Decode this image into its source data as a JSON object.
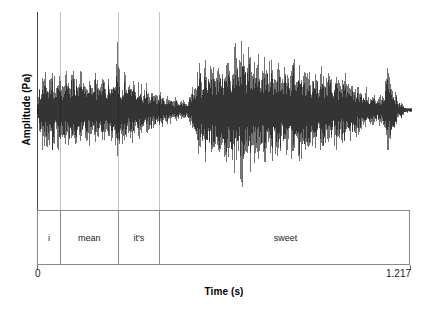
{
  "chart_data": {
    "type": "line",
    "title": "",
    "subtitle": "",
    "xlabel": "Time (s)",
    "ylabel": "Amplitude (Pa)",
    "xlim": [
      0,
      1.217
    ],
    "ylim": [
      -1,
      1
    ],
    "xtick_labels": [
      "0",
      "1.217"
    ],
    "xtick_values": [
      0,
      1.217
    ],
    "ytick_labels": [],
    "grid": false,
    "legend": null,
    "series_name": "speech waveform",
    "series_color": "#000000",
    "baseline": 0,
    "annotation_tier": {
      "name": "words",
      "boundaries_s": [
        0,
        0.0746,
        0.2627,
        0.3989,
        1.217
      ],
      "segments": [
        {
          "label": "i",
          "start_s": 0,
          "end_s": 0.0746
        },
        {
          "label": "mean",
          "start_s": 0.0746,
          "end_s": 0.2627
        },
        {
          "label": "it's",
          "start_s": 0.2627,
          "end_s": 0.3989
        },
        {
          "label": "sweet",
          "start_s": 0.3989,
          "end_s": 1.217
        }
      ]
    },
    "envelope": [
      [
        0.0,
        0.04
      ],
      [
        0.008,
        0.4
      ],
      [
        0.016,
        0.52
      ],
      [
        0.024,
        0.47
      ],
      [
        0.033,
        0.58
      ],
      [
        0.041,
        0.5
      ],
      [
        0.049,
        0.55
      ],
      [
        0.057,
        0.46
      ],
      [
        0.065,
        0.52
      ],
      [
        0.074,
        0.44
      ],
      [
        0.082,
        0.49
      ],
      [
        0.09,
        0.41
      ],
      [
        0.098,
        0.46
      ],
      [
        0.106,
        0.53
      ],
      [
        0.115,
        0.45
      ],
      [
        0.123,
        0.5
      ],
      [
        0.131,
        0.43
      ],
      [
        0.139,
        0.48
      ],
      [
        0.147,
        0.42
      ],
      [
        0.156,
        0.47
      ],
      [
        0.164,
        0.4
      ],
      [
        0.172,
        0.45
      ],
      [
        0.18,
        0.38
      ],
      [
        0.188,
        0.43
      ],
      [
        0.197,
        0.47
      ],
      [
        0.205,
        0.4
      ],
      [
        0.213,
        0.44
      ],
      [
        0.221,
        0.38
      ],
      [
        0.229,
        0.42
      ],
      [
        0.238,
        0.36
      ],
      [
        0.246,
        0.41
      ],
      [
        0.254,
        0.46
      ],
      [
        0.262,
        0.74
      ],
      [
        0.27,
        0.52
      ],
      [
        0.279,
        0.44
      ],
      [
        0.287,
        0.48
      ],
      [
        0.295,
        0.4
      ],
      [
        0.303,
        0.44
      ],
      [
        0.311,
        0.37
      ],
      [
        0.32,
        0.41
      ],
      [
        0.328,
        0.34
      ],
      [
        0.336,
        0.38
      ],
      [
        0.344,
        0.31
      ],
      [
        0.352,
        0.35
      ],
      [
        0.361,
        0.28
      ],
      [
        0.369,
        0.32
      ],
      [
        0.377,
        0.25
      ],
      [
        0.385,
        0.28
      ],
      [
        0.393,
        0.21
      ],
      [
        0.402,
        0.24
      ],
      [
        0.41,
        0.18
      ],
      [
        0.418,
        0.2
      ],
      [
        0.426,
        0.15
      ],
      [
        0.434,
        0.17
      ],
      [
        0.443,
        0.13
      ],
      [
        0.451,
        0.16
      ],
      [
        0.459,
        0.12
      ],
      [
        0.467,
        0.14
      ],
      [
        0.475,
        0.11
      ],
      [
        0.484,
        0.13
      ],
      [
        0.492,
        0.16
      ],
      [
        0.5,
        0.22
      ],
      [
        0.508,
        0.34
      ],
      [
        0.516,
        0.46
      ],
      [
        0.525,
        0.54
      ],
      [
        0.533,
        0.6
      ],
      [
        0.541,
        0.57
      ],
      [
        0.549,
        0.62
      ],
      [
        0.557,
        0.58
      ],
      [
        0.566,
        0.64
      ],
      [
        0.574,
        0.6
      ],
      [
        0.582,
        0.66
      ],
      [
        0.59,
        0.62
      ],
      [
        0.598,
        0.68
      ],
      [
        0.607,
        0.64
      ],
      [
        0.615,
        0.7
      ],
      [
        0.623,
        0.66
      ],
      [
        0.631,
        0.72
      ],
      [
        0.639,
        0.68
      ],
      [
        0.648,
        0.88
      ],
      [
        0.656,
        0.74
      ],
      [
        0.664,
        0.96
      ],
      [
        0.672,
        0.78
      ],
      [
        0.68,
        0.7
      ],
      [
        0.689,
        0.76
      ],
      [
        0.697,
        0.68
      ],
      [
        0.705,
        0.74
      ],
      [
        0.713,
        0.66
      ],
      [
        0.721,
        0.72
      ],
      [
        0.73,
        0.64
      ],
      [
        0.738,
        0.78
      ],
      [
        0.746,
        0.7
      ],
      [
        0.754,
        0.62
      ],
      [
        0.762,
        0.68
      ],
      [
        0.771,
        0.6
      ],
      [
        0.779,
        0.66
      ],
      [
        0.787,
        0.58
      ],
      [
        0.795,
        0.64
      ],
      [
        0.803,
        0.56
      ],
      [
        0.812,
        0.62
      ],
      [
        0.82,
        0.54
      ],
      [
        0.828,
        0.6
      ],
      [
        0.836,
        0.66
      ],
      [
        0.844,
        0.58
      ],
      [
        0.853,
        0.64
      ],
      [
        0.861,
        0.56
      ],
      [
        0.869,
        0.62
      ],
      [
        0.877,
        0.54
      ],
      [
        0.885,
        0.6
      ],
      [
        0.894,
        0.52
      ],
      [
        0.902,
        0.58
      ],
      [
        0.91,
        0.5
      ],
      [
        0.918,
        0.56
      ],
      [
        0.926,
        0.48
      ],
      [
        0.935,
        0.54
      ],
      [
        0.943,
        0.46
      ],
      [
        0.951,
        0.52
      ],
      [
        0.959,
        0.44
      ],
      [
        0.967,
        0.5
      ],
      [
        0.976,
        0.42
      ],
      [
        0.984,
        0.48
      ],
      [
        0.992,
        0.4
      ],
      [
        1.0,
        0.46
      ],
      [
        1.008,
        0.38
      ],
      [
        1.017,
        0.42
      ],
      [
        1.025,
        0.34
      ],
      [
        1.033,
        0.38
      ],
      [
        1.041,
        0.3
      ],
      [
        1.049,
        0.34
      ],
      [
        1.058,
        0.26
      ],
      [
        1.066,
        0.3
      ],
      [
        1.074,
        0.22
      ],
      [
        1.082,
        0.26
      ],
      [
        1.09,
        0.19
      ],
      [
        1.099,
        0.22
      ],
      [
        1.107,
        0.17
      ],
      [
        1.115,
        0.2
      ],
      [
        1.123,
        0.24
      ],
      [
        1.131,
        0.38
      ],
      [
        1.14,
        0.54
      ],
      [
        1.148,
        0.44
      ],
      [
        1.156,
        0.3
      ],
      [
        1.164,
        0.2
      ],
      [
        1.172,
        0.14
      ],
      [
        1.181,
        0.1
      ],
      [
        1.189,
        0.07
      ],
      [
        1.197,
        0.05
      ],
      [
        1.205,
        0.03
      ],
      [
        1.217,
        0.02
      ]
    ]
  },
  "axes": {
    "ylabel": "Amplitude (Pa)",
    "xlabel": "Time (s)",
    "tick_start": "0",
    "tick_end": "1.217"
  },
  "tier": {
    "cells": [
      {
        "label": "i"
      },
      {
        "label": "mean"
      },
      {
        "label": "it's"
      },
      {
        "label": "sweet"
      }
    ]
  },
  "style": {
    "waveform_color": "#000000",
    "axis_color": "#444444",
    "guide_color": "#c3c3c3",
    "box_border_color": "#8a8a8a",
    "background": "#ffffff"
  }
}
